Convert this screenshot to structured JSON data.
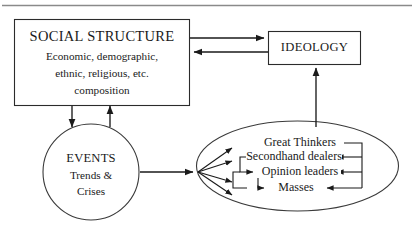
{
  "diagram": {
    "type": "flow-diagram",
    "background_color": "#ffffff",
    "line_color": "#1a1a1a",
    "text_color": "#1a1a1a",
    "top_rule_color": "#8a8a8a",
    "nodes": {
      "social_structure": {
        "shape": "rectangle",
        "title": "SOCIAL STRUCTURE",
        "line1": "Economic, demographic,",
        "line2": "ethnic, religious, etc.",
        "line3": "composition"
      },
      "ideology": {
        "shape": "rectangle",
        "title": "IDEOLOGY"
      },
      "events": {
        "shape": "circle",
        "title": "EVENTS",
        "line1": "Trends &",
        "line2": "Crises"
      },
      "actors": {
        "shape": "ellipse",
        "items": [
          {
            "label": "Great Thinkers"
          },
          {
            "label": "Secondhand dealers"
          },
          {
            "label": "Opinion leaders"
          },
          {
            "label": "Masses"
          }
        ]
      }
    },
    "edges": [
      {
        "from": "social_structure",
        "to": "ideology",
        "direction": "right"
      },
      {
        "from": "ideology",
        "to": "social_structure",
        "direction": "left"
      },
      {
        "from": "social_structure",
        "to": "events",
        "direction": "down"
      },
      {
        "from": "events",
        "to": "social_structure",
        "direction": "up"
      },
      {
        "from": "events",
        "to": "actors",
        "direction": "right"
      },
      {
        "from": "actors",
        "to": "ideology",
        "direction": "up"
      },
      {
        "from": "actors_fan",
        "to": "great_thinkers",
        "direction": "right"
      },
      {
        "from": "actors_fan",
        "to": "secondhand_dealers",
        "direction": "right"
      },
      {
        "from": "actors_fan",
        "to": "opinion_leaders",
        "direction": "right"
      },
      {
        "from": "actors_fan",
        "to": "masses",
        "direction": "right"
      },
      {
        "from": "great_thinkers",
        "to": "secondhand_dealers",
        "direction": "left"
      },
      {
        "from": "great_thinkers",
        "to": "opinion_leaders",
        "direction": "left"
      },
      {
        "from": "great_thinkers",
        "to": "masses",
        "direction": "left"
      },
      {
        "from": "secondhand_dealers",
        "to": "opinion_leaders",
        "direction": "right"
      },
      {
        "from": "opinion_leaders",
        "to": "masses",
        "direction": "right"
      }
    ]
  }
}
